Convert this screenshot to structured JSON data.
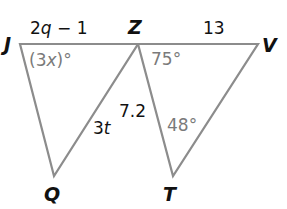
{
  "diagram": {
    "type": "geometry",
    "colors": {
      "edge": "#8c8c8c",
      "vertex_label": "#111111",
      "side_label": "#111111",
      "angle_label": "#7a7a7a"
    },
    "vertices": {
      "J": {
        "label": "J",
        "x": 20,
        "y": 44
      },
      "Z": {
        "label": "Z",
        "x": 138,
        "y": 44
      },
      "V": {
        "label": "V",
        "x": 258,
        "y": 44
      },
      "Q": {
        "label": "Q",
        "x": 54,
        "y": 176
      },
      "T": {
        "label": "T",
        "x": 173,
        "y": 176
      }
    },
    "sides": {
      "JZ": {
        "label_pre": "2",
        "label_var": "q",
        "label_post": " − 1"
      },
      "ZV": {
        "label": "13"
      },
      "ZT": {
        "label": "7.2"
      },
      "ZQ": {
        "label_pre": "3",
        "label_var": "t"
      }
    },
    "angles": {
      "J": {
        "label_pre": "(3",
        "label_var": "x",
        "label_post": ")°"
      },
      "Z": {
        "label": "75°"
      },
      "T": {
        "label": "48°"
      }
    }
  }
}
